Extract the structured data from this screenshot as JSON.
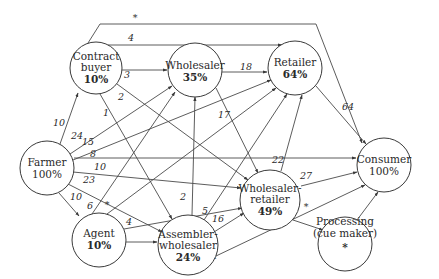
{
  "diagram": {
    "type": "flow-network",
    "nodes": [
      {
        "id": "contract_buyer",
        "lines": [
          "Contract",
          "buyer"
        ],
        "value": "10%",
        "value_bold": true,
        "cx": 96,
        "cy": 68,
        "r": 26
      },
      {
        "id": "wholesaler",
        "lines": [
          "Wholesaler"
        ],
        "value": "35%",
        "value_bold": true,
        "cx": 195,
        "cy": 70,
        "r": 27
      },
      {
        "id": "retailer",
        "lines": [
          "Retailer"
        ],
        "value": "64%",
        "value_bold": true,
        "cx": 295,
        "cy": 68,
        "r": 27
      },
      {
        "id": "farmer",
        "lines": [
          "Farmer"
        ],
        "value": "100%",
        "value_bold": false,
        "cx": 47,
        "cy": 168,
        "r": 27
      },
      {
        "id": "consumer",
        "lines": [
          "Consumer"
        ],
        "value": "100%",
        "value_bold": false,
        "cx": 384,
        "cy": 165,
        "r": 27
      },
      {
        "id": "wholesaler_retailer",
        "lines": [
          "Wholesaler-",
          "retailer"
        ],
        "value": "49%",
        "value_bold": true,
        "cx": 271,
        "cy": 200,
        "r": 30
      },
      {
        "id": "agent",
        "lines": [
          "Agent"
        ],
        "value": "10%",
        "value_bold": true,
        "cx": 99,
        "cy": 240,
        "r": 27
      },
      {
        "id": "assembler_wholesaler",
        "lines": [
          "Assembler-",
          "wholesaler"
        ],
        "value": "24%",
        "value_bold": true,
        "cx": 188,
        "cy": 245,
        "r": 30
      },
      {
        "id": "processing",
        "lines": [
          "Processing",
          "(cue maker)"
        ],
        "value": "*",
        "value_bold": false,
        "cx": 345,
        "cy": 244,
        "r": 27
      }
    ],
    "edges": [
      {
        "from": "farmer",
        "to": "contract_buyer",
        "label": "10"
      },
      {
        "from": "farmer",
        "to": "wholesaler",
        "label": "24"
      },
      {
        "from": "farmer",
        "to": "retailer",
        "label": "15"
      },
      {
        "from": "farmer",
        "to": "consumer",
        "label": "8"
      },
      {
        "from": "farmer",
        "to": "wholesaler_retailer",
        "label": "10"
      },
      {
        "from": "farmer",
        "to": "assembler_wholesaler",
        "label": "23"
      },
      {
        "from": "farmer",
        "to": "agent",
        "label": "10"
      },
      {
        "from": "contract_buyer",
        "to": "wholesaler",
        "label": "3"
      },
      {
        "from": "contract_buyer",
        "to": "retailer",
        "label": "4"
      },
      {
        "from": "contract_buyer",
        "to": "consumer",
        "label": "*"
      },
      {
        "from": "contract_buyer",
        "to": "wholesaler_retailer",
        "label": "2"
      },
      {
        "from": "contract_buyer",
        "to": "assembler_wholesaler",
        "label": "1"
      },
      {
        "from": "wholesaler",
        "to": "retailer",
        "label": "18"
      },
      {
        "from": "wholesaler",
        "to": "wholesaler_retailer",
        "label": "17"
      },
      {
        "from": "retailer",
        "to": "consumer",
        "label": "64"
      },
      {
        "from": "wholesaler_retailer",
        "to": "retailer",
        "label": "22"
      },
      {
        "from": "wholesaler_retailer",
        "to": "consumer",
        "label": "27"
      },
      {
        "from": "wholesaler_retailer",
        "to": "processing",
        "label": "*"
      },
      {
        "from": "agent",
        "to": "wholesaler",
        "label": "6"
      },
      {
        "from": "agent",
        "to": "retailer",
        "label": "*"
      },
      {
        "from": "agent",
        "to": "wholesaler_retailer",
        "label": "4"
      },
      {
        "from": "agent",
        "to": "assembler_wholesaler",
        "label": "*"
      },
      {
        "from": "assembler_wholesaler",
        "to": "wholesaler",
        "label": "2"
      },
      {
        "from": "assembler_wholesaler",
        "to": "retailer",
        "label": "5"
      },
      {
        "from": "assembler_wholesaler",
        "to": "wholesaler_retailer",
        "label": "16"
      },
      {
        "from": "assembler_wholesaler",
        "to": "consumer",
        "label": "1"
      },
      {
        "from": "processing",
        "to": "consumer",
        "label": ""
      }
    ]
  },
  "labels": {
    "cb_name1": "Contract",
    "cb_name2": "buyer",
    "cb_pct": "10%",
    "ws_name": "Wholesaler",
    "ws_pct": "35%",
    "rt_name": "Retailer",
    "rt_pct": "64%",
    "fa_name": "Farmer",
    "fa_pct": "100%",
    "co_name": "Consumer",
    "co_pct": "100%",
    "wr_name1": "Wholesaler-",
    "wr_name2": "retailer",
    "wr_pct": "49%",
    "ag_name": "Agent",
    "ag_pct": "10%",
    "aw_name1": "Assembler-",
    "aw_name2": "wholesaler",
    "aw_pct": "24%",
    "pr_name1": "Processing",
    "pr_name2": "(cue maker)",
    "pr_mark": "*",
    "e_fa_cb": "10",
    "e_fa_ws": "24",
    "e_fa_rt": "15",
    "e_fa_co": "8",
    "e_fa_wr": "10",
    "e_fa_aw": "23",
    "e_fa_ag": "10",
    "e_cb_ws": "3",
    "e_cb_rt": "4",
    "e_cb_co": "*",
    "e_cb_wr": "2",
    "e_cb_aw": "1",
    "e_ws_rt": "18",
    "e_ws_wr": "17",
    "e_rt_co": "64",
    "e_wr_rt": "22",
    "e_wr_co": "27",
    "e_wr_pr": "*",
    "e_ag_ws": "6",
    "e_ag_rt": "*",
    "e_ag_wr": "4",
    "e_ag_aw": "*",
    "e_aw_ws": "2",
    "e_aw_rt": "5",
    "e_aw_wr": "16",
    "e_aw_co": "1"
  }
}
